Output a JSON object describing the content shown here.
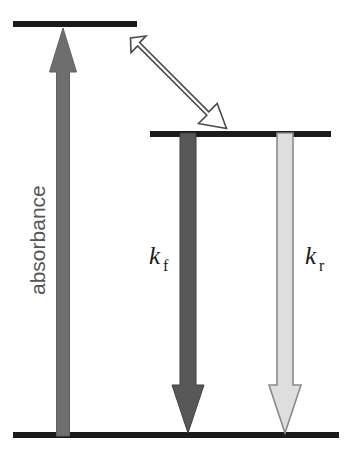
{
  "figure": {
    "type": "energy-level-diagram",
    "title": "",
    "background_color": "#ffffff"
  },
  "levels": [
    {
      "id": "excited-upper",
      "name": "upper-energy-level",
      "x1": 13,
      "x2": 137,
      "y": 24,
      "thickness": 6,
      "color": "#1a1a1a"
    },
    {
      "id": "excited-lower",
      "name": "intermediate-energy-level",
      "x1": 150,
      "x2": 331,
      "y": 134,
      "thickness": 6,
      "color": "#1a1a1a"
    },
    {
      "id": "ground",
      "name": "ground-energy-level",
      "x1": 13,
      "x2": 339,
      "y": 435,
      "thickness": 6,
      "color": "#1a1a1a"
    }
  ],
  "arrows": [
    {
      "id": "absorbance-arrow",
      "label": "absorbance",
      "direction": "up",
      "fill": "#6e6e6e",
      "stroke": "#5a5a5a",
      "x_center": 63,
      "y_tail": 435,
      "y_head": 28,
      "shaft_half_width": 6.5,
      "head_half_width": 13.5,
      "head_length": 44
    },
    {
      "id": "internal-conversion-arrow",
      "label": "",
      "direction": "diagonal-down-right",
      "fill": "#ffffff",
      "stroke": "#4a4a4a",
      "x_tail": 131,
      "y_tail": 38,
      "x_head": 226,
      "y_head": 128,
      "shaft_half_width": 8,
      "head_half_width": 16,
      "head_length": 30
    },
    {
      "id": "kf-arrow",
      "label": "k_f",
      "direction": "down",
      "fill": "#585858",
      "stroke": "#3a3a3a",
      "x_center": 188,
      "y_tail": 136,
      "y_head": 433,
      "shaft_half_width": 8,
      "head_half_width": 16,
      "head_length": 48
    },
    {
      "id": "kr-arrow",
      "label": "k_r",
      "direction": "down",
      "fill": "#dedede",
      "stroke": "#8a8a8a",
      "x_center": 285,
      "y_tail": 136,
      "y_head": 433,
      "shaft_half_width": 8,
      "head_half_width": 16,
      "head_length": 48
    }
  ],
  "labels": {
    "absorbance": {
      "text": "absorbance",
      "rotation": -90,
      "x": 44,
      "y": 295,
      "color": "#555555",
      "font_size": 21
    },
    "kf": {
      "base": "k",
      "subscript": "f",
      "x": 150,
      "y": 264,
      "color": "#1a1a1a"
    },
    "kr": {
      "base": "k",
      "subscript": "r",
      "x": 306,
      "y": 264,
      "color": "#1a1a1a"
    }
  },
  "colors": {
    "level_bar": "#1a1a1a",
    "absorbance_arrow": "#6e6e6e",
    "kf_arrow": "#585858",
    "kr_arrow": "#dedede",
    "ic_arrow_fill": "#ffffff",
    "ic_arrow_stroke": "#4a4a4a",
    "label_text": "#1a1a1a",
    "axis_text": "#555555"
  }
}
